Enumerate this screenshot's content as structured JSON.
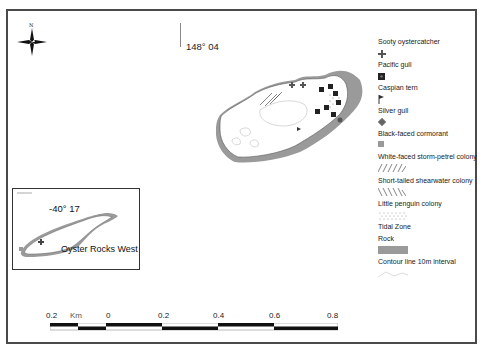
{
  "map": {
    "north_label": "N",
    "longitude_label": "148° 04",
    "island_main": "Oyster Rocks (main)",
    "inset": {
      "latitude_label": "-40° 17",
      "name": "Oyster Rocks West"
    }
  },
  "legend": {
    "items": [
      {
        "label": "Sooty oystercatcher",
        "icon": "cross-icon"
      },
      {
        "label": "Pacific gull",
        "icon": "dark-square-dot-icon"
      },
      {
        "label": "Caspian tern",
        "icon": "flag-icon"
      },
      {
        "label": "Silver gull",
        "icon": "diamond-cross-icon"
      },
      {
        "label": "Black-faced cormorant",
        "icon": "grey-square-icon"
      },
      {
        "label": "White-faced storm-petrel colony",
        "icon": "forward-hatch-icon"
      },
      {
        "label": "Short-tailed shearwater colony",
        "icon": "back-hatch-icon"
      },
      {
        "label": "Little penguin colony",
        "icon": "dotted-pattern-icon"
      },
      {
        "label": "Tidal Zone",
        "icon": "none"
      },
      {
        "label": "Rock",
        "icon": "grey-fill-icon"
      },
      {
        "label": "Contour line 10m interval",
        "icon": "contour-line-icon"
      }
    ]
  },
  "scale_bar": {
    "unit": "Km",
    "ticks": [
      "0.2",
      "0",
      "0.2",
      "0.4",
      "0.6",
      "0.8"
    ]
  },
  "colors": {
    "frame": "#4a4a4a",
    "rock": "#9a9a9a",
    "symbol": "#333333",
    "contour": "#d8d8d8"
  }
}
